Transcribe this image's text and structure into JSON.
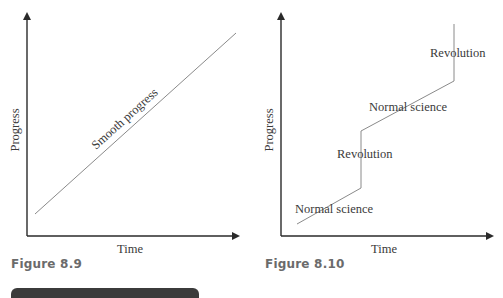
{
  "page": {
    "top_clipped_text": "Theory of scientific change"
  },
  "figures": [
    {
      "caption": "Figure 8.9",
      "xlabel": "Time",
      "ylabel": "Progress",
      "line_label": "Smooth progress"
    },
    {
      "caption": "Figure 8.10",
      "xlabel": "Time",
      "ylabel": "Progress",
      "labels": [
        "Normal science",
        "Revolution",
        "Normal science",
        "Revolution"
      ]
    }
  ],
  "colors": {
    "axis": "#2a2a2a",
    "line": "#8a8a8a",
    "caption": "#6b6b6b",
    "bar": "#3b3b3b"
  }
}
